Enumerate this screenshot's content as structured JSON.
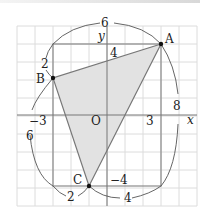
{
  "diagram": {
    "type": "coordinate-grid-triangle",
    "axes": {
      "x_label": "x",
      "y_label": "y",
      "origin_label": "O"
    },
    "points": [
      {
        "name": "A",
        "x": 3,
        "y": 4
      },
      {
        "name": "B",
        "x": -3,
        "y": 2
      },
      {
        "name": "C",
        "x": -1,
        "y": -4
      }
    ],
    "tick_labels": {
      "x_neg": "−3",
      "x_pos": "3",
      "y_pos": "4",
      "y_neg": "−4"
    },
    "dimension_labels": {
      "top_width": "6",
      "right_height": "8",
      "left_height": "6",
      "left_top_small": "2",
      "bottom_left_small": "2",
      "bottom_right": "4"
    },
    "colors": {
      "fill": "#e2e2e2",
      "grid": "#d9d9d9",
      "lines": "#777777",
      "arcs": "#555555"
    }
  }
}
